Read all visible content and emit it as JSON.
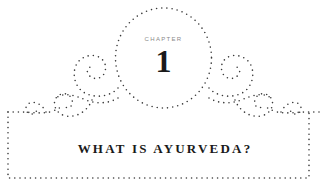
{
  "chapter": {
    "label": "CHAPTER",
    "number": "1",
    "title": "WHAT IS AYURVEDA?"
  },
  "ornament": {
    "style": "dotted-frame",
    "dot_color": "#3a3a3a",
    "text_color": "#1a1a1a",
    "label_color": "#8a8a8a",
    "background": "#ffffff"
  }
}
